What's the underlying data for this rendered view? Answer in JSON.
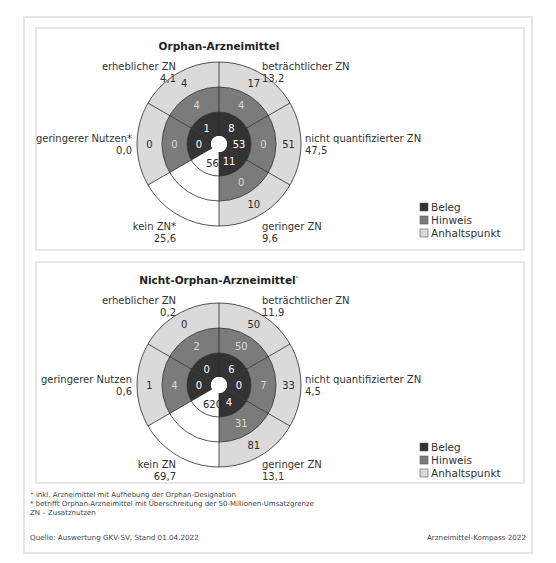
{
  "colors": {
    "beleg": "#333333",
    "hinweis": "#7b7b7b",
    "anhaltspunkt": "#dadada",
    "kein": "#ffffff",
    "stroke": "#2b2b2b"
  },
  "legend": [
    {
      "key": "beleg",
      "label": "Beleg"
    },
    {
      "key": "hinweis",
      "label": "Hinweis"
    },
    {
      "key": "anhaltspunkt",
      "label": "Anhaltspunkt"
    }
  ],
  "chart_data": [
    {
      "type": "pie",
      "subtype": "multi-ring sunburst (equal 60° sectors)",
      "title": "Orphan-Arzneimittel",
      "rings": [
        "Beleg",
        "Hinweis",
        "Anhaltspunkt"
      ],
      "categories": [
        {
          "name": "beträchtlicher ZN",
          "share": "13,2",
          "beleg": 8,
          "hinweis": 4,
          "anhaltspunkt": 17
        },
        {
          "name": "nicht quantifizierter ZN",
          "share": "47,5",
          "beleg": 53,
          "hinweis": 0,
          "anhaltspunkt": 51
        },
        {
          "name": "geringer ZN",
          "share": "9,6",
          "beleg": 11,
          "hinweis": 0,
          "anhaltspunkt": 10
        },
        {
          "name": "kein ZN*",
          "share": "25,6",
          "kein": 56
        },
        {
          "name": "geringerer Nutzen*",
          "share": "0,0",
          "beleg": 0,
          "hinweis": 0,
          "anhaltspunkt": 0
        },
        {
          "name": "erheblicher ZN",
          "share": "4,1",
          "beleg": 1,
          "hinweis": 4,
          "anhaltspunkt": 4
        }
      ]
    },
    {
      "type": "pie",
      "subtype": "multi-ring sunburst (equal 60° sectors)",
      "title": "Nicht-Orphan-Arzneimittel",
      "title_marker": "⁺",
      "rings": [
        "Beleg",
        "Hinweis",
        "Anhaltspunkt"
      ],
      "categories": [
        {
          "name": "beträchtlicher ZN",
          "share": "11,9",
          "beleg": 6,
          "hinweis": 50,
          "anhaltspunkt": 50
        },
        {
          "name": "nicht quantifizierter ZN",
          "share": "4,5",
          "beleg": 0,
          "hinweis": 7,
          "anhaltspunkt": 33
        },
        {
          "name": "geringer ZN",
          "share": "13,1",
          "beleg": 4,
          "hinweis": 31,
          "anhaltspunkt": 81
        },
        {
          "name": "kein ZN",
          "share": "69,7",
          "kein": 620
        },
        {
          "name": "geringerer Nutzen",
          "share": "0,6",
          "beleg": 0,
          "hinweis": 4,
          "anhaltspunkt": 1
        },
        {
          "name": "erheblicher ZN",
          "share": "0,2",
          "beleg": 0,
          "hinweis": 2,
          "anhaltspunkt": 0
        }
      ]
    }
  ],
  "footnotes": [
    "⁺ inkl. Arzneimittel mit Aufhebung der Orphan-Designation",
    "* betrifft Orphan-Arzneimittel mit Überschreitung der 50-Millionen-Umsatzgrenze",
    "ZN – Zusatznutzen"
  ],
  "source": "Quelle: Auswertung GKV-SV, Stand 01.04.2022",
  "brand": "Arzneimittel-Kompass 2022"
}
